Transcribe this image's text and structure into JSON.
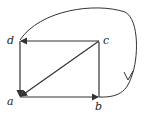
{
  "diagram": {
    "type": "directed-graph",
    "nodes": [
      {
        "id": "a",
        "label": "a"
      },
      {
        "id": "b",
        "label": "b"
      },
      {
        "id": "c",
        "label": "c"
      },
      {
        "id": "d",
        "label": "d"
      }
    ],
    "edges": [
      {
        "from": "a",
        "to": "b"
      },
      {
        "from": "b",
        "to": "c"
      },
      {
        "from": "c",
        "to": "d"
      },
      {
        "from": "d",
        "to": "a"
      },
      {
        "from": "c",
        "to": "a"
      },
      {
        "from": "d",
        "to": "b",
        "style": "curved"
      }
    ],
    "colors": {
      "stroke": "#333333",
      "background": "#ffffff"
    }
  }
}
